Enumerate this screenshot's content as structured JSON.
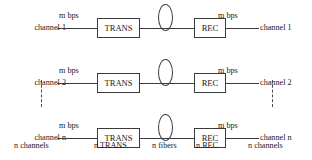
{
  "diagram": {
    "line_color": "#3a3a3a",
    "text_color": "#1a1a1a",
    "background": "#ffffff",
    "rows": [
      {
        "left_label": "channel 1",
        "left_rate": "m bps",
        "transmitter": "TRANS",
        "fiber": "fiber-loop-icon",
        "receiver": "REC",
        "right_rate": "m bps",
        "right_label": "channel 1"
      },
      {
        "left_label": "channel 2",
        "left_rate": "m bps",
        "transmitter": "TRANS",
        "fiber": "fiber-loop-icon",
        "receiver": "REC",
        "right_rate": "m bps",
        "right_label": "channel 2"
      },
      {
        "left_label": "channel n",
        "left_rate": "m bps",
        "transmitter": "TRANS",
        "fiber": "fiber-loop-icon",
        "receiver": "REC",
        "right_rate": "m bps",
        "right_label": "channel n"
      }
    ],
    "captions": {
      "input_channels": "n channels",
      "transmitters": "n TRANS",
      "fibers": "n fibers",
      "receivers": "n REC",
      "output_channels": "n channels"
    },
    "ellipsis": {
      "left": "vertical-dots",
      "right": "vertical-dots"
    }
  }
}
